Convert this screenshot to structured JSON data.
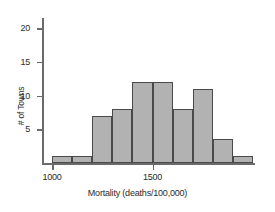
{
  "chart_data": {
    "type": "bar",
    "title": "",
    "xlabel": "Mortality (deaths/100,000)",
    "ylabel": "# of Towns",
    "categories": [
      "1000-1100",
      "1100-1200",
      "1200-1300",
      "1300-1400",
      "1400-1500",
      "1500-1600",
      "1600-1700",
      "1700-1800",
      "1800-1900",
      "1900-2000"
    ],
    "bin_edges": [
      1000,
      1100,
      1200,
      1300,
      1400,
      1500,
      1600,
      1700,
      1800,
      1900,
      2000
    ],
    "values": [
      1,
      1,
      7,
      8,
      12,
      12,
      8,
      11,
      3.5,
      1
    ],
    "bin_width": 100,
    "xlim": [
      950,
      2010
    ],
    "ylim": [
      0,
      21.5
    ],
    "xticks": [
      1000,
      1500
    ],
    "xtick_labels": [
      "1000",
      "1500"
    ],
    "yticks": [
      5,
      10,
      15,
      20
    ],
    "ytick_labels": [
      "5",
      "10",
      "15",
      "20"
    ],
    "grid": false,
    "legend": false,
    "bar_fill_color": "#b2b2b2",
    "bar_edge_color": "#4a4a4a",
    "axis_color": "#6b6b6b",
    "text_color": "#2b2b2b",
    "background_color": "#ffffff"
  }
}
